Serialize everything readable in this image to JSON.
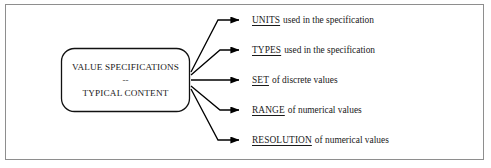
{
  "diagram": {
    "title_node": {
      "line1": "VALUE SPECIFICATIONS",
      "separator": "--",
      "line2": "TYPICAL CONTENT"
    },
    "branches": [
      {
        "keyword": "UNITS",
        "description": "used in the specification"
      },
      {
        "keyword": "TYPES",
        "description": "used in the specification"
      },
      {
        "keyword": "SET",
        "description": "of discrete values"
      },
      {
        "keyword": "RANGE",
        "description": "of numerical values"
      },
      {
        "keyword": "RESOLUTION",
        "description": "of numerical values"
      }
    ],
    "colors": {
      "frame_border": "#8e8e8e",
      "node_border": "#111111",
      "connector": "#000000",
      "text": "#1a1a1a",
      "background": "#ffffff"
    }
  }
}
